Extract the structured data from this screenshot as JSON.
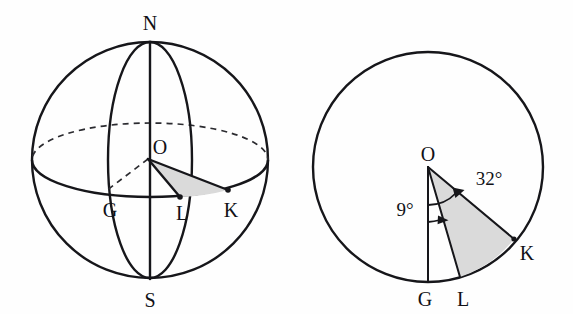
{
  "figure": {
    "background_color": "#fefefe",
    "ink_color": "#16161a",
    "shade_color": "#d9d9d9"
  },
  "left_panel": {
    "name": "sphere-3d-view",
    "shape": "sphere",
    "center": {
      "x": 150,
      "y": 160
    },
    "radius": 118,
    "equator": {
      "semi_major": 118,
      "semi_minor": 37,
      "front_style": "solid",
      "back_style": "dashed"
    },
    "meridian": {
      "semi_major": 118,
      "semi_minor": 42,
      "style": "solid"
    },
    "labels": {
      "north_pole": "N",
      "south_pole": "S",
      "center": "O",
      "greenwich": "G",
      "point_l": "L",
      "point_k": "K"
    },
    "points": {
      "north_pole": {
        "x": 150,
        "y": 42
      },
      "south_pole": {
        "x": 150,
        "y": 278
      },
      "center": {
        "x": 148,
        "y": 159
      },
      "greenwich": {
        "x": 118,
        "y": 196
      },
      "point_l": {
        "x": 180,
        "y": 197
      },
      "point_k": {
        "x": 228,
        "y": 190
      }
    },
    "shaded_region": "sector-O-L-K"
  },
  "right_panel": {
    "name": "equatorial-plane-view",
    "shape": "circle",
    "center": {
      "x": 428,
      "y": 167
    },
    "radius": 115,
    "labels": {
      "center": "O",
      "greenwich": "G",
      "point_l": "L",
      "point_k": "K"
    },
    "points": {
      "center": {
        "x": 428,
        "y": 167
      },
      "greenwich": {
        "x": 428,
        "y": 282
      },
      "point_l": {
        "x": 460,
        "y": 277
      },
      "point_k": {
        "x": 514,
        "y": 239
      }
    },
    "angles": [
      {
        "id": "angle-gol",
        "label": "9°",
        "value": 9,
        "unit": "degree",
        "from": "G",
        "to": "L"
      },
      {
        "id": "angle-gok",
        "label": "32°",
        "value": 32,
        "unit": "degree",
        "from": "L",
        "to": "K"
      }
    ],
    "shaded_region": "sector-O-L-K"
  }
}
